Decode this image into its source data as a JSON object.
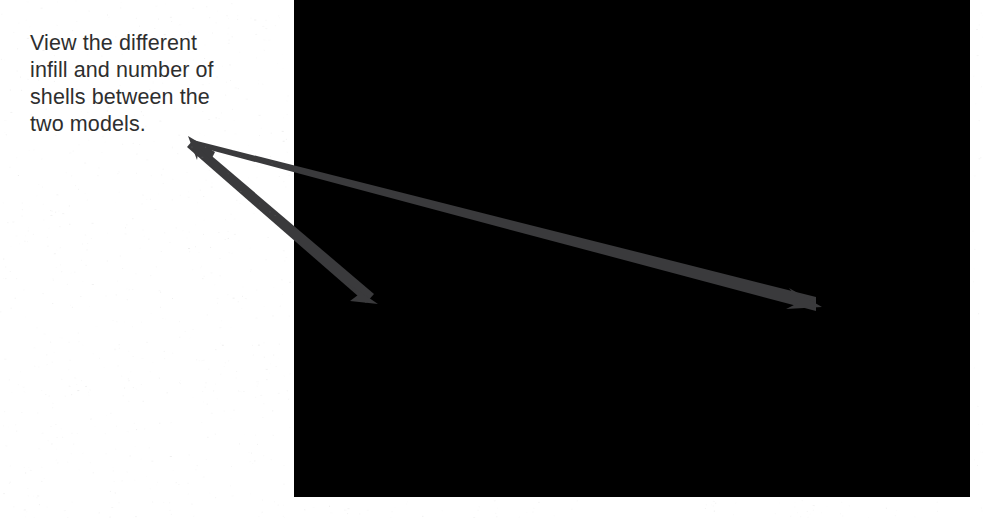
{
  "page": {
    "width": 983,
    "height": 518,
    "background": "#ffffff",
    "kind": "scanned-document-figure"
  },
  "caption": {
    "text": "View the different\ninfill and number of\nshells between the\ntwo models.",
    "lines": [
      "View the different",
      "infill and number of",
      "shells between the",
      "two models."
    ],
    "color": "#2e2e2e",
    "font_size_px": 21.5,
    "line_height_px": 27
  },
  "annotation": {
    "label": "two-headed-branching-arrow",
    "color": "#3a3a3c",
    "origin": {
      "x": 193,
      "y": 140
    },
    "arrows": [
      {
        "name": "arrow-to-left-model-infill",
        "from": {
          "x": 193,
          "y": 140
        },
        "to": {
          "x": 370,
          "y": 301
        },
        "target": "left model infill and shells"
      },
      {
        "name": "arrow-to-right-model-infill",
        "from": {
          "x": 193,
          "y": 140
        },
        "to": {
          "x": 816,
          "y": 304
        },
        "target": "right model infill and shells"
      }
    ],
    "shared_origin_head": {
      "name": "origin-arrowhead",
      "points_toward": "up-left",
      "at": {
        "x": 193,
        "y": 140
      }
    }
  },
  "photo": {
    "name": "photograph-of-two-3d-printed-hemispheres",
    "x": 294,
    "y": 0,
    "width": 676,
    "height": 497,
    "is_grayscale": true,
    "halftone": true,
    "base_gray": "#8a8a8a",
    "subjects": [
      {
        "name": "left-model",
        "description": "lighter gray sphere with coarse visible honeycomb infill and fewer shells",
        "tone": "#8e8e8e",
        "highlight_tone": "#a6a6a6"
      },
      {
        "name": "right-model",
        "description": "dark near-black sphere with dense infill and more shells",
        "tone": "#2b2b2b",
        "edge_tone": "#3d3d3d"
      }
    ],
    "boundary": {
      "name": "light-dark-model-boundary",
      "path_points": [
        {
          "x": 360,
          "y": 0
        },
        {
          "x": 368,
          "y": 120
        },
        {
          "x": 366,
          "y": 200
        }
      ]
    }
  }
}
